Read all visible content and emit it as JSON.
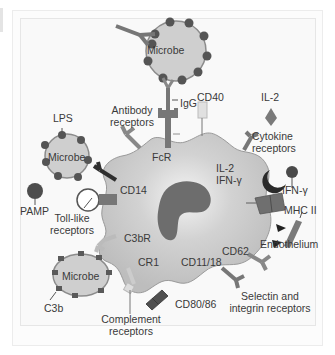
{
  "figure": {
    "colors": {
      "cell_fill": "#c8c8c8",
      "cell_stroke": "#8a8a8a",
      "nucleus": "#6a6a6a",
      "microbe_fill": "#cfcfcf",
      "bead": "#555555",
      "receptor": "#7a7a7a",
      "dark": "#2a2a2a",
      "frame_bg": "#f9f9f9"
    },
    "labels": {
      "microbe_top": "Microbe",
      "igg": "IgG",
      "cd40": "CD40",
      "il2_top": "IL-2",
      "antibody_receptors_line1": "Antibody",
      "antibody_receptors_line2": "receptors",
      "fcr": "FcR",
      "cytokine_receptors_line1": "Cytokine",
      "cytokine_receptors_line2": "receptors",
      "lps": "LPS",
      "microbe_left": "Microbe",
      "il2_cell": "IL-2",
      "ifn_cell": "IFN-γ",
      "ifn_ext": "IFN-γ",
      "cd14": "CD14",
      "pamp": "PAMP",
      "mhc2": "MHC II",
      "toll_line1": "Toll-like",
      "toll_line2": "receptors",
      "c3br": "C3bR",
      "endothelium": "Endothelium",
      "cd62": "CD62",
      "cr1": "CR1",
      "cd11_18": "CD11/18",
      "microbe_bottom": "Microbe",
      "c3b": "C3b",
      "cd80_86": "CD80/86",
      "complement_line1": "Complement",
      "complement_line2": "receptors",
      "selectin_line1": "Selectin and",
      "selectin_line2": "integrin receptors"
    }
  }
}
